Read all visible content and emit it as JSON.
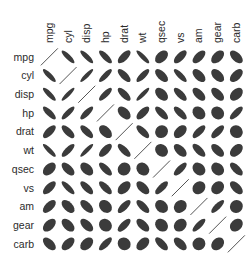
{
  "chart_data": {
    "type": "heatmap",
    "subtype": "correlation-ellipse",
    "title": "",
    "variables": [
      "mpg",
      "cyl",
      "disp",
      "hp",
      "drat",
      "wt",
      "qsec",
      "vs",
      "am",
      "gear",
      "carb"
    ],
    "row_labels": [
      "mpg",
      "cyl",
      "disp",
      "hp",
      "drat",
      "wt",
      "qsec",
      "vs",
      "am",
      "gear",
      "carb"
    ],
    "col_labels": [
      "mpg",
      "cyl",
      "disp",
      "hp",
      "drat",
      "wt",
      "qsec",
      "vs",
      "am",
      "gear",
      "carb"
    ],
    "matrix": [
      [
        1.0,
        -0.85,
        -0.85,
        -0.78,
        0.68,
        -0.87,
        0.42,
        0.66,
        0.6,
        0.48,
        -0.55
      ],
      [
        -0.85,
        1.0,
        0.9,
        0.83,
        -0.7,
        0.78,
        -0.59,
        -0.81,
        -0.52,
        -0.49,
        0.53
      ],
      [
        -0.85,
        0.9,
        1.0,
        0.79,
        -0.71,
        0.89,
        -0.43,
        -0.71,
        -0.59,
        -0.56,
        0.39
      ],
      [
        -0.78,
        0.83,
        0.79,
        1.0,
        -0.45,
        0.66,
        -0.71,
        -0.72,
        -0.24,
        -0.13,
        0.75
      ],
      [
        0.68,
        -0.7,
        -0.71,
        -0.45,
        1.0,
        -0.71,
        0.09,
        0.44,
        0.71,
        0.7,
        -0.09
      ],
      [
        -0.87,
        0.78,
        0.89,
        0.66,
        -0.71,
        1.0,
        -0.17,
        -0.55,
        -0.69,
        -0.58,
        0.43
      ],
      [
        0.42,
        -0.59,
        -0.43,
        -0.71,
        0.09,
        -0.17,
        1.0,
        0.74,
        -0.23,
        -0.21,
        -0.66
      ],
      [
        0.66,
        -0.81,
        -0.71,
        -0.72,
        0.44,
        -0.55,
        0.74,
        1.0,
        0.17,
        0.21,
        -0.57
      ],
      [
        0.6,
        -0.52,
        -0.59,
        -0.24,
        0.71,
        -0.69,
        -0.23,
        0.17,
        1.0,
        0.79,
        0.06
      ],
      [
        0.48,
        -0.49,
        -0.56,
        -0.13,
        0.7,
        -0.58,
        -0.21,
        0.21,
        0.79,
        1.0,
        0.27
      ],
      [
        -0.55,
        0.53,
        0.39,
        0.75,
        -0.09,
        0.43,
        -0.66,
        -0.57,
        0.06,
        0.27,
        1.0
      ]
    ],
    "value_range": [
      -1,
      1
    ],
    "legend": "none",
    "grid": false,
    "colors": {
      "ellipse_fill": "#3b3b3b",
      "diagonal_line": "#555555",
      "label": "#2b2b2b",
      "background": "#ffffff"
    }
  },
  "layout": {
    "grid_left": 40,
    "grid_top": 47.5,
    "cell": 18.7
  }
}
